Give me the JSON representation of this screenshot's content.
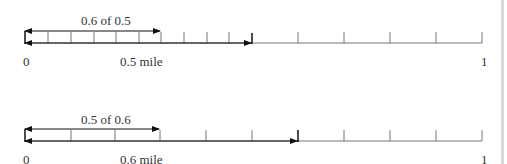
{
  "diagram": {
    "top": {
      "bracket_label": "0.6 of 0.5",
      "start_label": "0",
      "mid_label": "0.5 mile",
      "end_label": "1",
      "description": "Number line 0 to 1 with 0.5 divided into tenths; arrow spans 0.6 of 0.5"
    },
    "bottom": {
      "bracket_label": "0.5 of 0.6",
      "start_label": "0",
      "mid_label": "0.6 mile",
      "end_label": "1",
      "description": "Number line 0 to 1 with 0.6 divided into fifths (tenths); arrow spans 0.5 of 0.6"
    },
    "colors": {
      "line": "#666666",
      "arrow": "#111111",
      "text": "#333333"
    }
  }
}
